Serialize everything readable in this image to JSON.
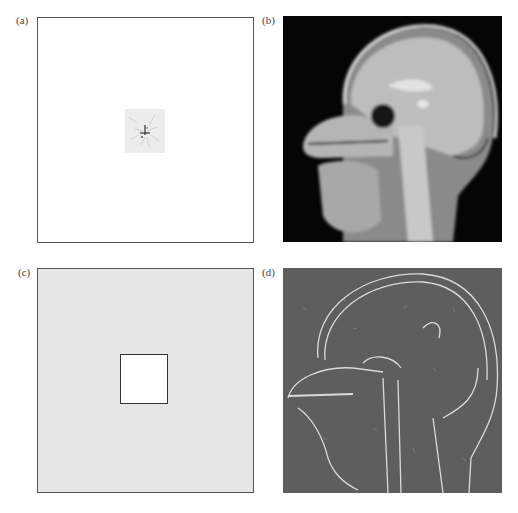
{
  "figure": {
    "panels": [
      {
        "id": "a",
        "label": "(a)",
        "description": "k-space-like sparse map: mostly white with a small gray speckled patch at center",
        "background": "#ffffff"
      },
      {
        "id": "b",
        "label": "(b)",
        "description": "Sagittal MRI head slice, blurred grayscale on black",
        "background": "#050505"
      },
      {
        "id": "c",
        "label": "(c)",
        "description": "Light gray noise field with central white square (masked region)",
        "background": "#e6e6e6",
        "inner_square": "#ffffff"
      },
      {
        "id": "d",
        "label": "(d)",
        "description": "Edge/detail map of sagittal head on mid-gray background",
        "background": "#5e5e5e"
      }
    ],
    "colors": {
      "frame": "#555555",
      "label": "#444444"
    }
  }
}
